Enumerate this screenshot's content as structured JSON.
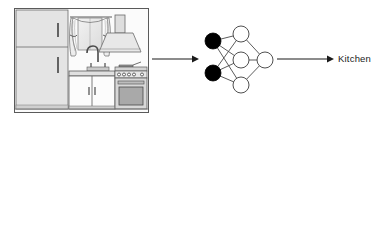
{
  "figure": {
    "background_color": "#ffffff",
    "line_color": "#1b1b1b",
    "node_fill_input": "#000000",
    "node_fill_hidden": "#ffffff",
    "node_stroke": "#3c3c3c",
    "scene_border_color": "#5a5a5a"
  },
  "rows": [
    {
      "id": "kitchen",
      "scene": {
        "name": "kitchen-scene-photo",
        "alt": "Kitchen interior line drawing",
        "objects": [
          "refrigerator",
          "window-with-curtains",
          "range-hood",
          "sink-faucet",
          "base-cabinets",
          "stove-oven",
          "countertop"
        ]
      },
      "input_arrow": {
        "name": "input-arrow",
        "direction": "right"
      },
      "network": {
        "name": "neural-network-diagram",
        "layers": [
          {
            "name": "input-layer",
            "nodes": 2,
            "fill": "black"
          },
          {
            "name": "hidden-layer",
            "nodes": 3,
            "fill": "white"
          },
          {
            "name": "output-layer",
            "nodes": 1,
            "fill": "white"
          }
        ]
      },
      "output_arrow": {
        "name": "output-arrow",
        "direction": "right"
      },
      "output_label": "Kitchen"
    },
    {
      "id": "bathroom",
      "scene": {
        "name": "bathroom-scene-photo",
        "alt": "Bathroom interior line drawing",
        "objects": [
          "shower-curtain",
          "bathtub",
          "shower-head",
          "wall-picture",
          "bottle",
          "tub-faucet",
          "towel-rack",
          "mirror",
          "vanity-sink",
          "vanity-cabinet"
        ]
      },
      "input_arrow": {
        "name": "input-arrow",
        "direction": "right"
      },
      "network": {
        "name": "neural-network-diagram",
        "layers": [
          {
            "name": "input-layer",
            "nodes": 2,
            "fill": "black"
          },
          {
            "name": "hidden-layer",
            "nodes": 3,
            "fill": "white"
          },
          {
            "name": "output-layer",
            "nodes": 1,
            "fill": "white"
          }
        ]
      },
      "output_arrow": {
        "name": "output-arrow",
        "direction": "right"
      },
      "output_label": "Bathroom"
    }
  ]
}
